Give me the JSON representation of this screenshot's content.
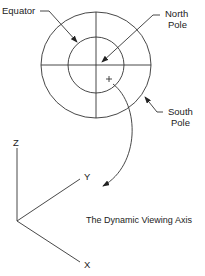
{
  "labels": {
    "equator": "Equator",
    "north_pole_1": "North",
    "north_pole_2": "Pole",
    "south_pole_1": "South",
    "south_pole_2": "Pole",
    "axis_z": "Z",
    "axis_y": "Y",
    "axis_x": "X",
    "caption": "The Dynamic Viewing Axis",
    "cursor_mark": "+"
  },
  "colors": {
    "stroke": "#333333",
    "text": "#222222",
    "background": "#ffffff"
  }
}
